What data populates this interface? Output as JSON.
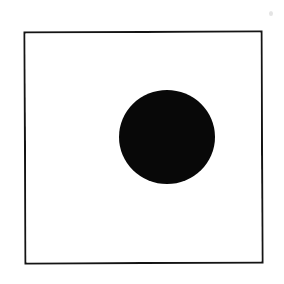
{
  "figure": {
    "description": "A thin black square outline containing one solid black filled circle placed right of center and above center.",
    "canvas": {
      "width": 284,
      "height": 284,
      "background_color": "#ffffff"
    },
    "frame": {
      "name": "square-outline",
      "shape": "square",
      "fill": "none",
      "stroke_color": "#141414",
      "stroke_width": 2,
      "left": 24,
      "top": 31,
      "width": 239,
      "height": 233,
      "rotation_degrees": -0.25
    },
    "shapes": [
      {
        "name": "filled-circle",
        "shape": "circle",
        "fill_color": "#080808",
        "stroke": "none",
        "center_x": 167,
        "center_y": 137,
        "radius_x": 48,
        "radius_y": 47,
        "left": 119,
        "top": 90,
        "width": 96,
        "height": 94
      }
    ],
    "artifacts": [
      {
        "name": "scan-speck",
        "shape": "dot",
        "color": "#e4e4e4",
        "left": 269,
        "top": 11,
        "width": 4,
        "height": 5
      }
    ]
  }
}
